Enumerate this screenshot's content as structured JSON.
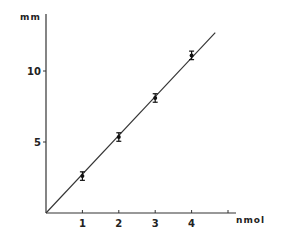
{
  "chart_data": {
    "type": "scatter",
    "title": "",
    "xlabel": "nmol",
    "ylabel": "mm",
    "xlim": [
      0,
      5.4
    ],
    "ylim": [
      0,
      14
    ],
    "grid": false,
    "legend": null,
    "x_ticks": [
      1,
      2,
      3,
      4,
      5
    ],
    "x_tick_labels": [
      "1",
      "2",
      "3",
      "4",
      ""
    ],
    "y_ticks": [
      5,
      10
    ],
    "y_tick_labels": [
      "5",
      "10"
    ],
    "series": [
      {
        "name": "measurements",
        "x": [
          1,
          2,
          3,
          4
        ],
        "y": [
          2.6,
          5.35,
          8.1,
          11.1
        ],
        "error": [
          0.3,
          0.3,
          0.3,
          0.3
        ],
        "marker": "filled-circle-with-error-bars"
      }
    ],
    "fit_line": {
      "type": "linear",
      "from": [
        0,
        0
      ],
      "to": [
        4.65,
        12.7
      ]
    }
  }
}
